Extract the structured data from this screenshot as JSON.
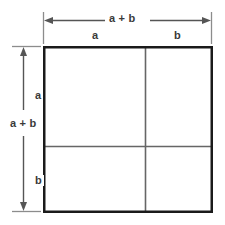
{
  "figure": {
    "type": "geometry-diagram",
    "background_color": "#ffffff",
    "outline_color": "#1a1a1a",
    "divider_color": "#666666",
    "dimension_color": "#555555",
    "text_color": "#3a3a3a"
  },
  "dimensions": {
    "top": {
      "total_label": "a + b",
      "segments": [
        {
          "label": "a"
        },
        {
          "label": "b"
        }
      ]
    },
    "left": {
      "total_label": "a + b",
      "segments": [
        {
          "label": "a"
        },
        {
          "label": "b"
        }
      ]
    }
  },
  "square": {
    "side_label": "a + b",
    "split_top_label": "a",
    "split_bottom_label": "b",
    "split_left_label": "a",
    "split_right_label": "b",
    "regions": [
      {
        "name": "top-left",
        "area_label": ""
      },
      {
        "name": "top-right",
        "area_label": ""
      },
      {
        "name": "bottom-left",
        "area_label": ""
      },
      {
        "name": "bottom-right",
        "area_label": ""
      }
    ]
  }
}
